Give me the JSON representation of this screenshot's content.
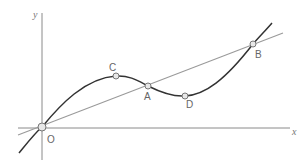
{
  "diagram": {
    "type": "function-graph-with-secant-line",
    "axes": {
      "x_label": "x",
      "y_label": "y",
      "origin_label": "O",
      "color": "#888888"
    },
    "curve": {
      "description": "cubic-like curve rising through O, local max at C, passing through A, local min at D, rising through B",
      "color": "#333333"
    },
    "line": {
      "description": "straight line through O, A and B",
      "color": "#999999"
    },
    "points": [
      {
        "id": "O",
        "label": "O"
      },
      {
        "id": "C",
        "label": "C"
      },
      {
        "id": "A",
        "label": "A"
      },
      {
        "id": "D",
        "label": "D"
      },
      {
        "id": "B",
        "label": "B"
      }
    ]
  }
}
